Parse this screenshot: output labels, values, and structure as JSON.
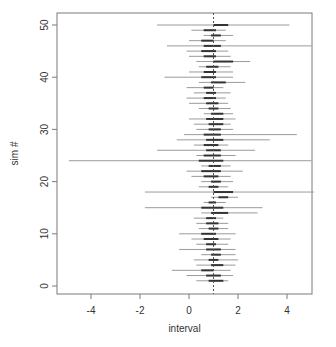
{
  "chart_data": {
    "type": "interval",
    "title": "",
    "xlabel": "interval",
    "ylabel": "sim #",
    "xlim": [
      -5.4,
      5.2
    ],
    "ylim": [
      -1.5,
      52.5
    ],
    "xticks": [
      -4,
      -2,
      0,
      2,
      4
    ],
    "xtick_labels": [
      "-4",
      "-2",
      "0",
      "2",
      "4"
    ],
    "yticks": [
      0,
      10,
      20,
      30,
      40,
      50
    ],
    "ytick_labels": [
      "0",
      "10",
      "20",
      "30",
      "40",
      "50"
    ],
    "reference_line": {
      "x": 1,
      "style": "dotted"
    },
    "grid": false,
    "legend": null,
    "series": [
      {
        "name": "outer interval",
        "color": "#9a9a9a"
      },
      {
        "name": "inner interval",
        "color": "#333333"
      }
    ],
    "intervals": [
      {
        "sim": 1,
        "lo": 0.3,
        "hi": 1.6,
        "inner_lo": 0.8,
        "inner_hi": 1.4
      },
      {
        "sim": 2,
        "lo": -0.1,
        "hi": 1.8,
        "inner_lo": 0.7,
        "inner_hi": 1.3
      },
      {
        "sim": 3,
        "lo": -0.7,
        "hi": 1.7,
        "inner_lo": 0.5,
        "inner_hi": 1.0
      },
      {
        "sim": 4,
        "lo": 0.3,
        "hi": 1.9,
        "inner_lo": 0.9,
        "inner_hi": 1.4
      },
      {
        "sim": 5,
        "lo": 0.2,
        "hi": 2.0,
        "inner_lo": 0.8,
        "inner_hi": 1.2
      },
      {
        "sim": 6,
        "lo": 0.5,
        "hi": 1.9,
        "inner_lo": 0.9,
        "inner_hi": 1.3
      },
      {
        "sim": 7,
        "lo": -0.4,
        "hi": 1.9,
        "inner_lo": 0.7,
        "inner_hi": 1.3
      },
      {
        "sim": 8,
        "lo": 0.3,
        "hi": 1.6,
        "inner_lo": 0.7,
        "inner_hi": 1.1
      },
      {
        "sim": 9,
        "lo": 0.1,
        "hi": 1.7,
        "inner_lo": 0.6,
        "inner_hi": 1.2
      },
      {
        "sim": 10,
        "lo": -0.4,
        "hi": 1.9,
        "inner_lo": 0.5,
        "inner_hi": 1.1
      },
      {
        "sim": 11,
        "lo": 0.4,
        "hi": 1.6,
        "inner_lo": 0.8,
        "inner_hi": 1.2
      },
      {
        "sim": 12,
        "lo": 0.3,
        "hi": 1.6,
        "inner_lo": 0.7,
        "inner_hi": 1.2
      },
      {
        "sim": 13,
        "lo": 0.2,
        "hi": 1.4,
        "inner_lo": 0.7,
        "inner_hi": 1.1
      },
      {
        "sim": 14,
        "lo": 0.5,
        "hi": 2.8,
        "inner_lo": 0.9,
        "inner_hi": 1.6
      },
      {
        "sim": 15,
        "lo": -1.8,
        "hi": 3.0,
        "inner_lo": 0.5,
        "inner_hi": 1.4
      },
      {
        "sim": 16,
        "lo": 0.6,
        "hi": 1.5,
        "inner_lo": 0.8,
        "inner_hi": 1.1
      },
      {
        "sim": 17,
        "lo": 0.9,
        "hi": 2.0,
        "inner_lo": 1.2,
        "inner_hi": 1.6
      },
      {
        "sim": 18,
        "lo": -1.8,
        "hi": 5.1,
        "inner_lo": 1.0,
        "inner_hi": 1.8
      },
      {
        "sim": 19,
        "lo": 0.4,
        "hi": 1.6,
        "inner_lo": 0.8,
        "inner_hi": 1.2
      },
      {
        "sim": 20,
        "lo": 0.5,
        "hi": 1.8,
        "inner_lo": 0.9,
        "inner_hi": 1.3
      },
      {
        "sim": 21,
        "lo": 0.1,
        "hi": 1.7,
        "inner_lo": 0.6,
        "inner_hi": 1.2
      },
      {
        "sim": 22,
        "lo": -0.1,
        "hi": 2.2,
        "inner_lo": 0.5,
        "inner_hi": 1.3
      },
      {
        "sim": 23,
        "lo": 0.5,
        "hi": 1.7,
        "inner_lo": 0.8,
        "inner_hi": 1.3
      },
      {
        "sim": 24,
        "lo": -4.9,
        "hi": 5.0,
        "inner_lo": 0.4,
        "inner_hi": 1.4
      },
      {
        "sim": 25,
        "lo": 0.3,
        "hi": 1.9,
        "inner_lo": 0.6,
        "inner_hi": 1.3
      },
      {
        "sim": 26,
        "lo": -1.3,
        "hi": 2.7,
        "inner_lo": 0.7,
        "inner_hi": 1.3
      },
      {
        "sim": 27,
        "lo": 0.2,
        "hi": 1.6,
        "inner_lo": 0.6,
        "inner_hi": 1.2
      },
      {
        "sim": 28,
        "lo": -0.5,
        "hi": 3.3,
        "inner_lo": 0.7,
        "inner_hi": 1.4
      },
      {
        "sim": 29,
        "lo": -0.2,
        "hi": 4.4,
        "inner_lo": 0.6,
        "inner_hi": 1.3
      },
      {
        "sim": 30,
        "lo": 0.3,
        "hi": 1.8,
        "inner_lo": 0.8,
        "inner_hi": 1.3
      },
      {
        "sim": 31,
        "lo": 0.2,
        "hi": 1.7,
        "inner_lo": 0.8,
        "inner_hi": 1.4
      },
      {
        "sim": 32,
        "lo": 0.0,
        "hi": 1.9,
        "inner_lo": 0.7,
        "inner_hi": 1.4
      },
      {
        "sim": 33,
        "lo": 0.6,
        "hi": 1.8,
        "inner_lo": 0.9,
        "inner_hi": 1.4
      },
      {
        "sim": 34,
        "lo": 0.4,
        "hi": 1.7,
        "inner_lo": 0.8,
        "inner_hi": 1.2
      },
      {
        "sim": 35,
        "lo": 0.0,
        "hi": 1.6,
        "inner_lo": 0.7,
        "inner_hi": 1.2
      },
      {
        "sim": 36,
        "lo": -0.1,
        "hi": 1.5,
        "inner_lo": 0.6,
        "inner_hi": 1.1
      },
      {
        "sim": 37,
        "lo": 0.2,
        "hi": 1.7,
        "inner_lo": 0.7,
        "inner_hi": 1.1
      },
      {
        "sim": 38,
        "lo": -0.1,
        "hi": 1.4,
        "inner_lo": 0.6,
        "inner_hi": 1.0
      },
      {
        "sim": 39,
        "lo": 0.4,
        "hi": 2.3,
        "inner_lo": 0.9,
        "inner_hi": 1.5
      },
      {
        "sim": 40,
        "lo": -1.0,
        "hi": 1.8,
        "inner_lo": 0.5,
        "inner_hi": 1.1
      },
      {
        "sim": 41,
        "lo": 0.0,
        "hi": 1.8,
        "inner_lo": 0.6,
        "inner_hi": 1.1
      },
      {
        "sim": 42,
        "lo": 0.4,
        "hi": 1.7,
        "inner_lo": 0.7,
        "inner_hi": 1.2
      },
      {
        "sim": 43,
        "lo": 0.3,
        "hi": 2.5,
        "inner_lo": 1.0,
        "inner_hi": 1.8
      },
      {
        "sim": 44,
        "lo": 0.0,
        "hi": 1.7,
        "inner_lo": 0.6,
        "inner_hi": 1.1
      },
      {
        "sim": 45,
        "lo": -0.1,
        "hi": 1.6,
        "inner_lo": 0.5,
        "inner_hi": 1.1
      },
      {
        "sim": 46,
        "lo": -0.9,
        "hi": 5.0,
        "inner_lo": 0.6,
        "inner_hi": 1.3
      },
      {
        "sim": 47,
        "lo": 0.0,
        "hi": 1.5,
        "inner_lo": 0.5,
        "inner_hi": 1.0
      },
      {
        "sim": 48,
        "lo": 0.6,
        "hi": 1.8,
        "inner_lo": 0.9,
        "inner_hi": 1.3
      },
      {
        "sim": 49,
        "lo": 0.1,
        "hi": 1.5,
        "inner_lo": 0.6,
        "inner_hi": 1.1
      },
      {
        "sim": 50,
        "lo": -1.3,
        "hi": 4.1,
        "inner_lo": 1.0,
        "inner_hi": 1.6
      }
    ]
  },
  "layout": {
    "plot_left": 57,
    "plot_top": 13,
    "plot_right": 312,
    "plot_bottom": 294,
    "x0_px": 189,
    "px_per_x": 24.5,
    "y0_px": 286,
    "px_per_y": 5.22
  }
}
